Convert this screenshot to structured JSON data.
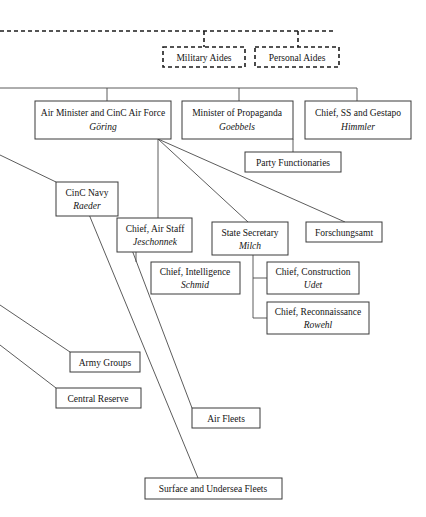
{
  "diagram": {
    "type": "org-chart",
    "background_color": "#ffffff",
    "line_color": "#4a4a4a",
    "box_border_color": "#3a3a3a",
    "text_color": "#141414"
  },
  "nodes": {
    "military_aides": {
      "title": "Military Aides",
      "person": "",
      "style": "dashed"
    },
    "personal_aides": {
      "title": "Personal Aides",
      "person": "",
      "style": "dashed"
    },
    "air_minister": {
      "title": "Air Minister and CinC Air Force",
      "person": "Göring",
      "style": "solid"
    },
    "propaganda": {
      "title": "Minister of Propaganda",
      "person": "Goebbels",
      "style": "solid"
    },
    "ss_gestapo": {
      "title": "Chief, SS and Gestapo",
      "person": "Himmler",
      "style": "solid"
    },
    "party_functionaries": {
      "title": "Party Functionaries",
      "person": "",
      "style": "solid"
    },
    "cinc_navy": {
      "title": "CinC Navy",
      "person": "Raeder",
      "style": "solid"
    },
    "air_staff": {
      "title": "Chief, Air Staff",
      "person": "Jeschonnek",
      "style": "solid"
    },
    "state_secretary": {
      "title": "State Secretary",
      "person": "Milch",
      "style": "solid"
    },
    "forschungsamt": {
      "title": "Forschungsamt",
      "person": "",
      "style": "solid"
    },
    "intelligence": {
      "title": "Chief, Intelligence",
      "person": "Schmid",
      "style": "solid"
    },
    "construction": {
      "title": "Chief, Construction",
      "person": "Udet",
      "style": "solid"
    },
    "reconnaissance": {
      "title": "Chief, Reconnaissance",
      "person": "Rowehl",
      "style": "solid"
    },
    "army_groups": {
      "title": "Army Groups",
      "person": "",
      "style": "solid"
    },
    "central_reserve": {
      "title": "Central Reserve",
      "person": "",
      "style": "solid"
    },
    "air_fleets": {
      "title": "Air Fleets",
      "person": "",
      "style": "solid"
    },
    "surface_undersea": {
      "title": "Surface and Undersea Fleets",
      "person": "",
      "style": "solid"
    }
  }
}
